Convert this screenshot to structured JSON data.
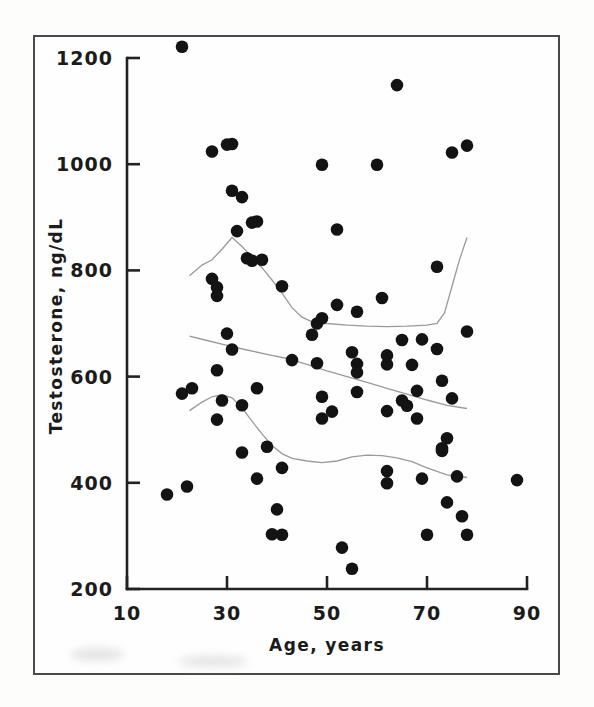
{
  "figure": {
    "background_color": "#fdfdfc",
    "frame_color": "#4a4a4a",
    "point_color": "#131313",
    "curve_color": "#9a9a9a",
    "axis_color": "#222222"
  },
  "chart_data": {
    "type": "scatter",
    "title": "",
    "xlabel": "Age, years",
    "ylabel": "Testosterone, ng/dL",
    "xlim": [
      10,
      90
    ],
    "ylim": [
      200,
      1200
    ],
    "xticks": [
      10,
      30,
      50,
      70,
      90
    ],
    "xticklabels": [
      "10",
      "30",
      "50",
      "70",
      "90"
    ],
    "yticks": [
      200,
      400,
      600,
      800,
      1000,
      1200
    ],
    "yticklabels": [
      "200",
      "400",
      "600",
      "800",
      "1000",
      "1200"
    ],
    "grid": false,
    "legend": null,
    "marker": "filled-circle",
    "points": [
      [
        21,
        1221
      ],
      [
        18,
        378
      ],
      [
        22,
        393
      ],
      [
        21,
        568
      ],
      [
        23,
        578
      ],
      [
        27,
        1024
      ],
      [
        30,
        1037
      ],
      [
        31,
        1038
      ],
      [
        27,
        784
      ],
      [
        28,
        768
      ],
      [
        28,
        752
      ],
      [
        28,
        612
      ],
      [
        31,
        950
      ],
      [
        33,
        938
      ],
      [
        30,
        681
      ],
      [
        31,
        651
      ],
      [
        29,
        555
      ],
      [
        28,
        519
      ],
      [
        32,
        874
      ],
      [
        35,
        890
      ],
      [
        36,
        892
      ],
      [
        34,
        823
      ],
      [
        35,
        818
      ],
      [
        37,
        820
      ],
      [
        33,
        546
      ],
      [
        33,
        457
      ],
      [
        36,
        578
      ],
      [
        36,
        408
      ],
      [
        38,
        468
      ],
      [
        41,
        770
      ],
      [
        41,
        428
      ],
      [
        40,
        350
      ],
      [
        39,
        303
      ],
      [
        41,
        302
      ],
      [
        43,
        631
      ],
      [
        47,
        679
      ],
      [
        48,
        700
      ],
      [
        49,
        710
      ],
      [
        49,
        999
      ],
      [
        48,
        625
      ],
      [
        49,
        562
      ],
      [
        49,
        521
      ],
      [
        51,
        534
      ],
      [
        52,
        735
      ],
      [
        52,
        877
      ],
      [
        53,
        278
      ],
      [
        55,
        238
      ],
      [
        55,
        646
      ],
      [
        56,
        624
      ],
      [
        56,
        608
      ],
      [
        56,
        722
      ],
      [
        56,
        571
      ],
      [
        60,
        999
      ],
      [
        61,
        748
      ],
      [
        62,
        623
      ],
      [
        62,
        640
      ],
      [
        62,
        535
      ],
      [
        62,
        422
      ],
      [
        62,
        399
      ],
      [
        64,
        1149
      ],
      [
        65,
        669
      ],
      [
        65,
        555
      ],
      [
        66,
        545
      ],
      [
        67,
        622
      ],
      [
        68,
        521
      ],
      [
        68,
        573
      ],
      [
        69,
        408
      ],
      [
        69,
        670
      ],
      [
        70,
        302
      ],
      [
        72,
        807
      ],
      [
        72,
        652
      ],
      [
        73,
        592
      ],
      [
        73,
        465
      ],
      [
        73,
        460
      ],
      [
        74,
        484
      ],
      [
        74,
        363
      ],
      [
        75,
        1022
      ],
      [
        75,
        559
      ],
      [
        76,
        412
      ],
      [
        77,
        337
      ],
      [
        78,
        1035
      ],
      [
        78,
        685
      ],
      [
        78,
        302
      ],
      [
        88,
        405
      ]
    ],
    "curves": [
      {
        "name": "upper-percentile-curve",
        "points": [
          [
            22.5,
            790
          ],
          [
            25,
            810
          ],
          [
            27,
            820
          ],
          [
            29,
            840
          ],
          [
            31,
            862
          ],
          [
            33,
            845
          ],
          [
            35,
            825
          ],
          [
            37,
            805
          ],
          [
            39,
            782
          ],
          [
            41,
            757
          ],
          [
            43,
            730
          ],
          [
            45,
            712
          ],
          [
            47,
            703
          ],
          [
            50,
            700
          ],
          [
            54,
            697
          ],
          [
            58,
            695
          ],
          [
            62,
            694
          ],
          [
            66,
            695
          ],
          [
            70,
            697
          ],
          [
            72,
            700
          ],
          [
            73.5,
            720
          ],
          [
            75,
            770
          ],
          [
            76.5,
            820
          ],
          [
            78,
            862
          ]
        ]
      },
      {
        "name": "median-curve",
        "points": [
          [
            22.5,
            676
          ],
          [
            26,
            668
          ],
          [
            30,
            659
          ],
          [
            34,
            650
          ],
          [
            38,
            642
          ],
          [
            42,
            634
          ],
          [
            46,
            623
          ],
          [
            50,
            611
          ],
          [
            54,
            600
          ],
          [
            58,
            589
          ],
          [
            62,
            578
          ],
          [
            66,
            567
          ],
          [
            70,
            556
          ],
          [
            74,
            546
          ],
          [
            78,
            540
          ]
        ]
      },
      {
        "name": "lower-percentile-curve",
        "points": [
          [
            22.5,
            536
          ],
          [
            25,
            552
          ],
          [
            27,
            562
          ],
          [
            29,
            566
          ],
          [
            31,
            560
          ],
          [
            33,
            541
          ],
          [
            35,
            516
          ],
          [
            37,
            492
          ],
          [
            39,
            470
          ],
          [
            41,
            455
          ],
          [
            43,
            446
          ],
          [
            46,
            441
          ],
          [
            49,
            438
          ],
          [
            52,
            441
          ],
          [
            55,
            449
          ],
          [
            58,
            452
          ],
          [
            61,
            451
          ],
          [
            64,
            447
          ],
          [
            67,
            440
          ],
          [
            70,
            428
          ],
          [
            74,
            415
          ],
          [
            78,
            410
          ]
        ]
      }
    ]
  }
}
